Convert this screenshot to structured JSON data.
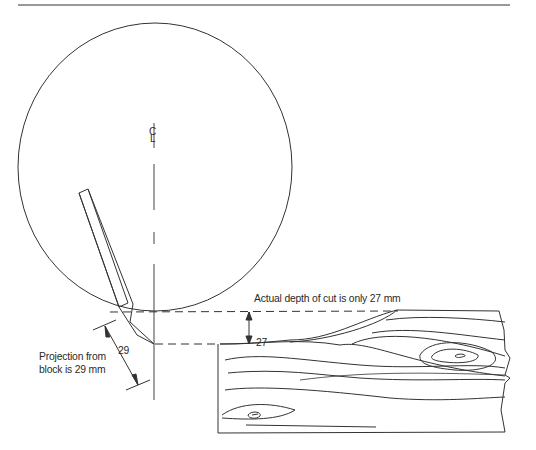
{
  "figure": {
    "centerline_symbol": "CL",
    "labels": {
      "actual_depth": "Actual depth of cut is only 27 mm",
      "projection_line1": "Projection from",
      "projection_line2": "block is 29 mm",
      "dim_projection": "29",
      "dim_depth": "27"
    },
    "colors": {
      "line": "#333333",
      "background": "#ffffff"
    }
  }
}
